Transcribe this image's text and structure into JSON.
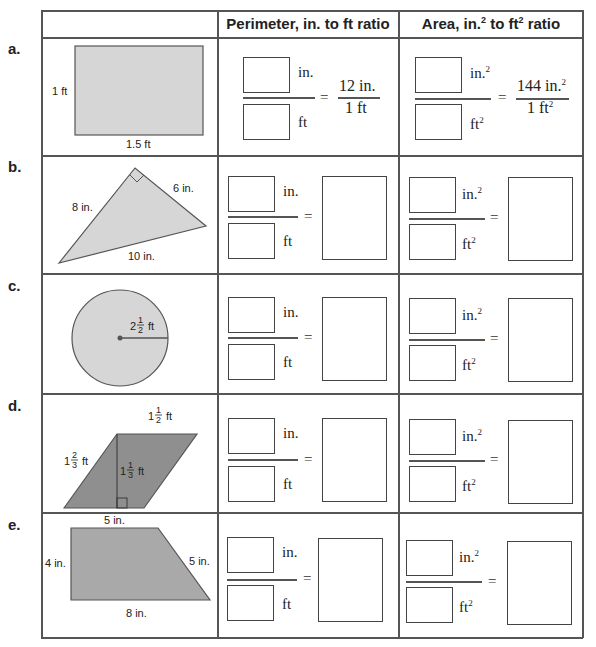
{
  "header": {
    "blank": "",
    "perimeter": {
      "text": "Perimeter, in. to ft ratio"
    },
    "area": {
      "pre": "Area, in.",
      "sup1": "2",
      "mid": " to ft",
      "sup2": "2",
      "post": " ratio"
    }
  },
  "units": {
    "in": "in.",
    "ft": "ft",
    "sq": "2",
    "eq": "="
  },
  "rows": [
    {
      "label": "a.",
      "shape": "rectangle",
      "dims": {
        "height": "1 ft",
        "width": "1.5 ft"
      },
      "perimeter_given": {
        "num": "12 in.",
        "den": "1 ft"
      },
      "area_given": {
        "num": "144 in.",
        "num_sup": "2",
        "den": "1 ft",
        "den_sup": "2"
      }
    },
    {
      "label": "b.",
      "shape": "right-triangle",
      "dims": {
        "leg1": "8 in.",
        "leg2": "6 in.",
        "hyp": "10 in."
      }
    },
    {
      "label": "c.",
      "shape": "circle",
      "dims": {
        "radius_whole": "2",
        "radius_num": "1",
        "radius_den": "2",
        "radius_unit": "ft"
      }
    },
    {
      "label": "d.",
      "shape": "parallelogram",
      "dims": {
        "base_whole": "1",
        "base_num": "1",
        "base_den": "2",
        "base_unit": "ft",
        "side_whole": "1",
        "side_num": "2",
        "side_den": "3",
        "side_unit": "ft",
        "height_whole": "1",
        "height_num": "1",
        "height_den": "3",
        "height_unit": "ft"
      }
    },
    {
      "label": "e.",
      "shape": "trapezoid",
      "dims": {
        "top": "5 in.",
        "left": "4 in.",
        "slant": "5 in.",
        "bottom": "8 in."
      }
    }
  ],
  "colors": {
    "shape_fill_light": "#d6d6d6",
    "shape_fill_dark": "#8f8f8f",
    "line": "#555555"
  }
}
